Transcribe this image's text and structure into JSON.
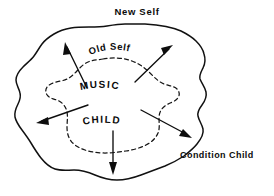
{
  "diagram": {
    "type": "concentric-boundary-flow",
    "title": "New Self",
    "background_color": "#ffffff",
    "ink_color": "#0d0d0d",
    "labels": {
      "outer_top": "New Self",
      "old_self": "Old Self",
      "music": "MUSIC",
      "child": "CHILD",
      "condition_child": "Condition Child"
    },
    "regions": [
      {
        "name": "new-self-boundary",
        "label": "New Self",
        "style": "solid",
        "description": "outermost hand-drawn irregular closed blob"
      },
      {
        "name": "old-self-boundary",
        "label": "Old Self",
        "style": "dashed",
        "description": "inner dashed irregular boundary enclosing MUSIC and CHILD"
      }
    ],
    "nodes": [
      {
        "name": "music-node",
        "label": "MUSIC"
      },
      {
        "name": "child-node",
        "label": "CHILD"
      }
    ],
    "arrows": [
      {
        "name": "arrow-up-left",
        "direction": "up-left",
        "from": "MUSIC",
        "to": "New Self"
      },
      {
        "name": "arrow-up-right",
        "direction": "up-right",
        "from": "MUSIC",
        "to": "New Self"
      },
      {
        "name": "arrow-left",
        "direction": "left",
        "from": "CHILD",
        "to": "New Self"
      },
      {
        "name": "arrow-down-right",
        "direction": "down-right",
        "from": "CHILD",
        "to": "Condition Child"
      },
      {
        "name": "arrow-down",
        "direction": "down",
        "from": "CHILD",
        "to": "New Self"
      }
    ]
  }
}
